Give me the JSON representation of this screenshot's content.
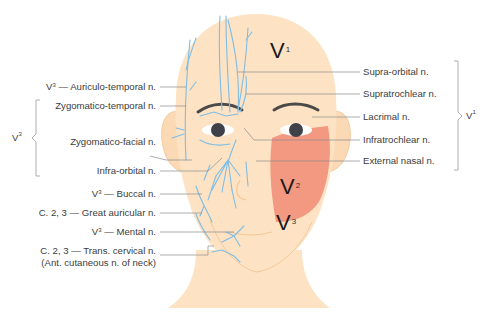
{
  "diagram": {
    "zones": [
      {
        "base": "V",
        "sup": "1"
      },
      {
        "base": "V",
        "sup": "2"
      },
      {
        "base": "V",
        "sup": "3"
      }
    ],
    "left_labels": [
      {
        "prefix": "V",
        "prefix_sup": "3",
        "text": " — Auriculo-temporal n."
      },
      {
        "text": "Zygomatico-temporal n."
      },
      {
        "text": "Zygomatico-facial n."
      },
      {
        "text": "Infra-orbital n."
      },
      {
        "prefix": "V",
        "prefix_sup": "3",
        "text": " — Buccal n."
      },
      {
        "text": "C. 2, 3 — Great auricular n."
      },
      {
        "prefix": "V",
        "prefix_sup": "3",
        "text": " — Mental n."
      },
      {
        "text": "C. 2, 3 — Trans. cervical n."
      },
      {
        "text": "(Ant. cutaneous n. of neck)"
      }
    ],
    "left_group": {
      "base": "V",
      "sup": "3"
    },
    "right_labels": [
      {
        "text": "Supra-orbital n."
      },
      {
        "text": "Supratrochlear n."
      },
      {
        "text": "Lacrimal n."
      },
      {
        "text": "Infratrochlear n."
      },
      {
        "text": "External nasal n."
      }
    ],
    "right_group": {
      "base": "V",
      "sup": "1"
    },
    "colors": {
      "skin": "#fde3c4",
      "skin_outline": "#f3c99a",
      "nerve": "#7fbde4",
      "v2_zone": "#f2907a",
      "leader_line": "#8a8a8a",
      "brow": "#4a4a4a",
      "eye": "#3e4147"
    }
  }
}
